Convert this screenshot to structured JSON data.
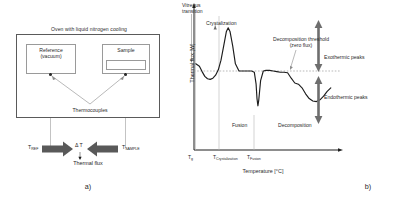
{
  "figure": {
    "panel_a": {
      "caption": "a)",
      "oven_title": "Oven with liquid nitrogen cooling",
      "reference_label_line1": "Reference",
      "reference_label_line2": "(vacuum)",
      "sample_label": "Sample",
      "thermocouples_label": "Thermocouples",
      "t_ref_label": "T",
      "t_ref_sub": "REF",
      "t_sample_label": "T",
      "t_sample_sub": "SAMPLE",
      "delta_t_label": "Δ T",
      "thermal_flux_label": "Thermal flux"
    },
    "panel_b": {
      "caption": "b)"
    }
  },
  "chart_data": {
    "type": "line",
    "title": "",
    "xlabel": "Temperature [°C]",
    "ylabel": "Thermal flux [W]",
    "grid": false,
    "legend": "none",
    "xlim": [
      0,
      160
    ],
    "ylim": [
      -100,
      100
    ],
    "zero_line_label": "Decomposition threshold",
    "zero_line_sublabel": "(zero flux)",
    "tick_labels": [
      {
        "text": "T",
        "sub": "g",
        "x": 12
      },
      {
        "text": "T",
        "sub": "Crystalization",
        "x": 37
      },
      {
        "text": "T",
        "sub": "Fusion",
        "x": 71
      }
    ],
    "annotations": [
      {
        "name": "vitreous-transition",
        "line1": "Vitreous",
        "line2": "transition"
      },
      {
        "name": "crystalization",
        "text": "Crystalization"
      },
      {
        "name": "fusion",
        "text": "Fusion"
      },
      {
        "name": "decomposition",
        "text": "Decomposition"
      },
      {
        "name": "exothermic",
        "text": "Exothermic peaks"
      },
      {
        "name": "endothermic",
        "text": "Endothermic peaks"
      }
    ],
    "series": [
      {
        "name": "DSC heat flow",
        "x": [
          2,
          6,
          9,
          12,
          15,
          18,
          21,
          24,
          27,
          30,
          33,
          36,
          38,
          40,
          43,
          46,
          50,
          55,
          60,
          64,
          67,
          69,
          70,
          71,
          72,
          74,
          77,
          80,
          84,
          88,
          92,
          96,
          100,
          104,
          108,
          112,
          116,
          120,
          124,
          128,
          132,
          136,
          140,
          144,
          148,
          152
        ],
        "y": [
          12,
          8,
          -1,
          -9,
          -13,
          -14,
          -12,
          -7,
          2,
          18,
          42,
          66,
          72,
          66,
          42,
          12,
          0,
          0,
          0,
          0,
          -2,
          -22,
          -46,
          -58,
          -48,
          -16,
          0,
          1,
          1,
          0,
          -1,
          -2,
          -2,
          -3,
          -12,
          -20,
          -22,
          -28,
          -38,
          -46,
          -50,
          -51,
          -48,
          -42,
          -34,
          -28
        ]
      }
    ]
  }
}
